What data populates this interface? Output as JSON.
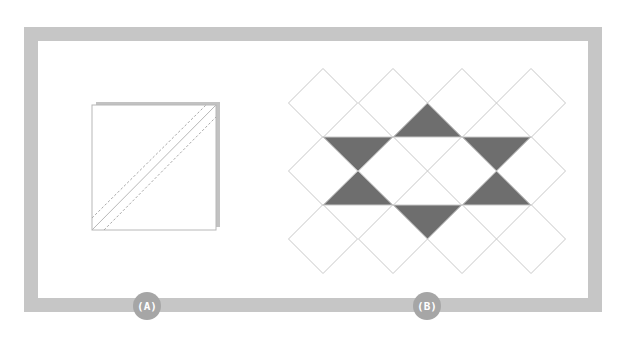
{
  "colors": {
    "background": "#ffffff",
    "frame": "#c6c6c6",
    "badge_fill": "#a6a6a6",
    "badge_text": "#ffffff",
    "grid_line": "#c8c8c8",
    "dark_fill": "#6e6e6e",
    "square_line": "#b8b8b8",
    "square_back": "#c2c2c2",
    "dashed_line": "#a9a9a9"
  },
  "frame": {
    "outer": [
      24,
      27,
      602,
      312
    ],
    "thickness": 14
  },
  "panels": [
    {
      "id": "A",
      "label": "(A)",
      "badge_center": [
        147,
        306
      ],
      "description": "Two stacked squares with a diagonal seam line and two dashed sewing lines",
      "back_square": [
        96,
        102,
        220,
        227
      ],
      "front_square": [
        92,
        105,
        216,
        230
      ],
      "solid_diagonal": [
        [
          92,
          230
        ],
        [
          216,
          105
        ]
      ],
      "dashed_lines": [
        [
          [
            92,
            218
          ],
          [
            206,
            105
          ]
        ],
        [
          [
            104,
            230
          ],
          [
            216,
            117
          ]
        ]
      ]
    },
    {
      "id": "B",
      "label": "(B)",
      "badge_center": [
        427,
        306
      ],
      "description": "Diamond grid with six dark triangles forming a star",
      "diamond_centers_x": [
        323,
        393,
        462,
        531
      ],
      "diamond_centers_y": [
        103,
        171,
        239
      ],
      "half_diagonal": 34.5,
      "band_lines_y": [
        137,
        205
      ],
      "dark_triangles": [
        [
          [
            393,
            137
          ],
          [
            462,
            137
          ],
          [
            427.5,
            103
          ]
        ],
        [
          [
            323,
            137
          ],
          [
            393,
            137
          ],
          [
            358,
            171
          ]
        ],
        [
          [
            462,
            137
          ],
          [
            531,
            137
          ],
          [
            496.5,
            171
          ]
        ],
        [
          [
            323,
            205
          ],
          [
            393,
            205
          ],
          [
            358,
            171
          ]
        ],
        [
          [
            462,
            205
          ],
          [
            531,
            205
          ],
          [
            496.5,
            171
          ]
        ],
        [
          [
            393,
            205
          ],
          [
            462,
            205
          ],
          [
            427.5,
            239
          ]
        ]
      ]
    }
  ]
}
